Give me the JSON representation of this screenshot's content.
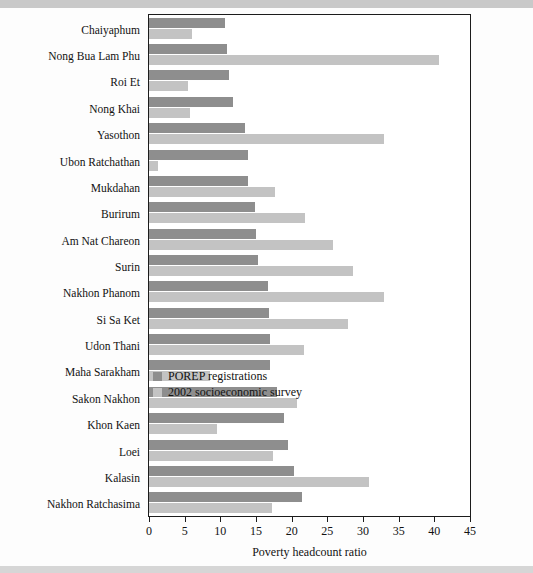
{
  "figure": {
    "axis_title": "Poverty headcount ratio"
  },
  "legend": {
    "position": "inside-right-middle",
    "entries": [
      {
        "label": "POREP registrations",
        "color": "#8e8e8e",
        "swatch": "dark-gray-swatch"
      },
      {
        "label": "2002 socioeconomic survey",
        "color": "#c3c3c3",
        "swatch": "light-gray-swatch"
      }
    ]
  },
  "axis": {
    "ticks": [
      "0",
      "5",
      "10",
      "15",
      "20",
      "25",
      "30",
      "35",
      "40",
      "45"
    ],
    "tick_values": [
      0,
      5,
      10,
      15,
      20,
      25,
      30,
      35,
      40,
      45
    ]
  },
  "chart_data": {
    "type": "bar",
    "orientation": "horizontal",
    "title": "",
    "subtitle": "",
    "xlabel": "Poverty headcount ratio",
    "ylabel": "",
    "xlim": [
      0,
      45
    ],
    "grid": false,
    "legend_position": "inside right middle",
    "categories": [
      "Chaiyaphum",
      "Nong Bua Lam Phu",
      "Roi Et",
      "Nong Khai",
      "Yasothon",
      "Ubon Ratchathan",
      "Mukdahan",
      "Burirum",
      "Am Nat Chareon",
      "Surin",
      "Nakhon Phanom",
      "Si Sa Ket",
      "Udon Thani",
      "Maha Sarakham",
      "Sakon Nakhon",
      "Khon Kaen",
      "Loei",
      "Kalasin",
      "Nakhon Ratchasima"
    ],
    "series": [
      {
        "name": "POREP registrations",
        "color": "#8e8e8e",
        "values": [
          10.7,
          11.0,
          11.2,
          11.8,
          13.5,
          13.9,
          13.9,
          14.8,
          15.0,
          15.3,
          16.7,
          16.8,
          17.0,
          17.0,
          18.0,
          18.9,
          19.5,
          20.3,
          21.5
        ]
      },
      {
        "name": "2002 socioeconomic survey",
        "color": "#c3c3c3",
        "values": [
          6.0,
          40.7,
          5.5,
          5.7,
          33.0,
          1.3,
          17.6,
          21.9,
          25.8,
          28.6,
          32.9,
          27.9,
          21.7,
          8.6,
          20.7,
          9.5,
          17.4,
          30.8,
          17.3
        ]
      }
    ]
  }
}
